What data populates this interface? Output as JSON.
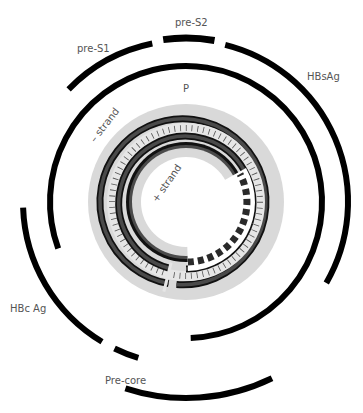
{
  "diagram": {
    "center": [
      186,
      202
    ],
    "colors": {
      "background": "#ffffff",
      "arc": "#000000",
      "strand_dark": "#3a3a3a",
      "strand_outline": "#111111",
      "gray_region": "#d9d9d9",
      "tick_band": "#e4e4e4",
      "label": "#555555"
    },
    "labels": {
      "pre_s1": "pre-S1",
      "pre_s2": "pre-S2",
      "hbsag": "HBsAg",
      "p": "P",
      "minus_strand": "– strand",
      "plus_strand": "+ strand",
      "hbcag": "HBc Ag",
      "precore": "Pre-core"
    },
    "genes": [
      {
        "name": "pre-S1",
        "radius": 162,
        "start_deg": -136,
        "end_deg": -102
      },
      {
        "name": "pre-S2",
        "radius": 164,
        "start_deg": -98,
        "end_deg": -80
      },
      {
        "name": "HBsAg",
        "radius": 162,
        "start_deg": -76,
        "end_deg": 30
      },
      {
        "name": "P",
        "radius": 136,
        "start_deg": 160,
        "end_deg": 448
      },
      {
        "name": "HBc Ag",
        "radius": 163,
        "start_deg": 178,
        "end_deg": 121
      },
      {
        "name": "Pre-core",
        "radius": 163,
        "start_deg": 116,
        "end_deg": 107
      },
      {
        "name": "X/bottom",
        "radius": 196,
        "start_deg": 108,
        "end_deg": 64
      }
    ],
    "dna": {
      "minus_strand": "outer circle (complete, with small gap)",
      "plus_strand": "inner circle (incomplete, dashed region)"
    }
  }
}
